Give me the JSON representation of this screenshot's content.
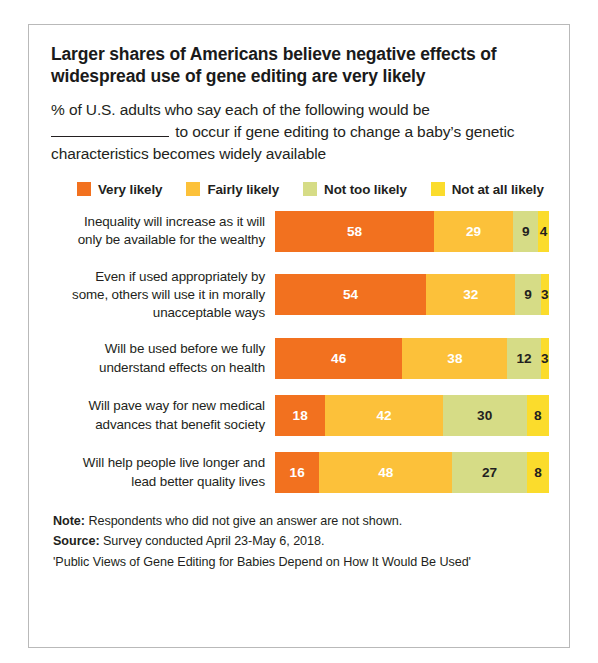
{
  "title": "Larger shares of Americans believe negative effects of widespread use of gene editing are very likely",
  "subtitle": {
    "before_blank": "% of U.S. adults who say each of the following would be",
    "after_blank": "to occur if gene editing to change a baby’s genetic characteristics becomes widely available"
  },
  "legend": [
    {
      "label": "Very likely",
      "color": "#f2711f"
    },
    {
      "label": "Fairly likely",
      "color": "#fcc13a"
    },
    {
      "label": "Not too likely",
      "color": "#d6dc86"
    },
    {
      "label": "Not at all likely",
      "color": "#fbdc2c"
    }
  ],
  "footer": {
    "note_label": "Note:",
    "note_text": " Respondents who did not give an answer are not shown.",
    "source_label": "Source:",
    "source_text": " Survey conducted April 23-May 6, 2018.",
    "report": "'Public Views of Gene Editing for Babies Depend on How It Would Be Used'"
  },
  "chart_data": {
    "type": "bar",
    "subtype": "stacked-horizontal-100",
    "title": "Larger shares of Americans believe negative effects of widespread use of gene editing are very likely",
    "subtitle": "% of U.S. adults who say each of the following would be ______ to occur if gene editing to change a baby’s genetic characteristics becomes widely available",
    "xlabel": "",
    "ylabel": "",
    "xlim": [
      0,
      100
    ],
    "grid": false,
    "legend_position": "top",
    "categories": [
      "Inequality will increase as it will only be available for the wealthy",
      "Even if used appropriately by some, others will use it in morally unacceptable ways",
      "Will be used before we fully understand effects on health",
      "Will pave way for new medical advances that benefit society",
      "Will help people live longer and lead better quality lives"
    ],
    "category_lines": [
      [
        "Inequality will increase as it will",
        "only be available for the wealthy"
      ],
      [
        "Even if used appropriately by",
        "some, others will use it in morally",
        "unacceptable ways"
      ],
      [
        "Will be used before we fully",
        "understand effects on health"
      ],
      [
        "Will pave way for new medical",
        "advances that benefit society"
      ],
      [
        "Will help people live longer and",
        "lead better quality lives"
      ]
    ],
    "series": [
      {
        "name": "Very likely",
        "color": "#f2711f",
        "values": [
          58,
          54,
          46,
          18,
          16
        ]
      },
      {
        "name": "Fairly likely",
        "color": "#fcc13a",
        "values": [
          29,
          32,
          38,
          42,
          48
        ]
      },
      {
        "name": "Not too likely",
        "color": "#d6dc86",
        "values": [
          9,
          9,
          12,
          30,
          27
        ]
      },
      {
        "name": "Not at all likely",
        "color": "#fbdc2c",
        "values": [
          4,
          3,
          3,
          8,
          8
        ]
      }
    ],
    "label_text_colors": [
      [
        "light",
        "light",
        "dark",
        "dark"
      ],
      [
        "light",
        "light",
        "dark",
        "dark"
      ],
      [
        "light",
        "light",
        "dark",
        "dark"
      ],
      [
        "light",
        "light",
        "dark",
        "dark"
      ],
      [
        "light",
        "light",
        "dark",
        "dark"
      ]
    ]
  }
}
